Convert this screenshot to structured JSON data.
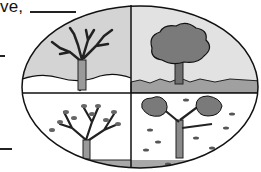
{
  "worksheet": {
    "prompt_fragment": "ve,",
    "answer_blanks": [
      {
        "id": "blank-top",
        "x": 30,
        "y": 11,
        "w": 46
      },
      {
        "id": "blank-left-1",
        "x": 0,
        "y": 55,
        "w": 5
      },
      {
        "id": "blank-left-2",
        "x": 0,
        "y": 148,
        "w": 12
      }
    ]
  },
  "illustration": {
    "title": "Four seasons tree",
    "quadrants": [
      {
        "position": "top-left",
        "season": "winter",
        "description": "bare tree with no leaves"
      },
      {
        "position": "top-right",
        "season": "summer",
        "description": "tree with full leafy canopy"
      },
      {
        "position": "bottom-left",
        "season": "spring",
        "description": "tree with small budding leaves"
      },
      {
        "position": "bottom-right",
        "season": "autumn",
        "description": "tree with falling leaves"
      }
    ],
    "colors": {
      "outline": "#111111",
      "sky_fill": "#d4d4d4",
      "ground_fill": "#a8a8a8",
      "canopy_fill": "#7a7a7a"
    }
  }
}
